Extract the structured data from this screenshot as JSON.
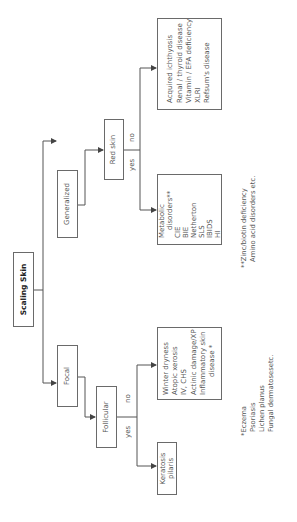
{
  "diagram": {
    "type": "decision-tree",
    "orientation": "rotated-90-ccw",
    "root": {
      "label": "Scaling Skin"
    },
    "branches": {
      "generalized": {
        "label": "Generalized",
        "decision": {
          "label": "Red skin",
          "yes_label": "yes",
          "no_label": "no",
          "yes_outcome": [
            "Metabolic",
            "disorders**",
            "CIE",
            "BIE",
            "Netherton",
            "SLS",
            "IBIDS",
            "HI"
          ],
          "no_outcome": [
            "Acquired ichthyosis",
            "Renal / thyroid disease",
            "Vitamin / EFA deficiency",
            "XLRI",
            "Refsum's disease"
          ]
        }
      },
      "focal": {
        "label": "Focal",
        "decision": {
          "label": "Follicular",
          "yes_label": "yes",
          "no_label": "no",
          "yes_outcome": [
            "Keratosis",
            "pilaris"
          ],
          "no_outcome": [
            "Winter dryness",
            "Atopic xerosis",
            "IV, CHS",
            "Actinic damage/XP",
            "Inflammatory skin",
            "disease *"
          ]
        }
      }
    },
    "footnotes": {
      "double_star": [
        "**Zinc/biotin deficiency",
        "Amino acid disorders etc."
      ],
      "single_star": [
        "*Eczema",
        "Psoriasis",
        "Lichen planus",
        "Fungal dermatosesetc."
      ]
    },
    "colors": {
      "line": "#555555",
      "box_border": "#6a6a6a",
      "text": "#555555",
      "background": "#ffffff"
    }
  }
}
